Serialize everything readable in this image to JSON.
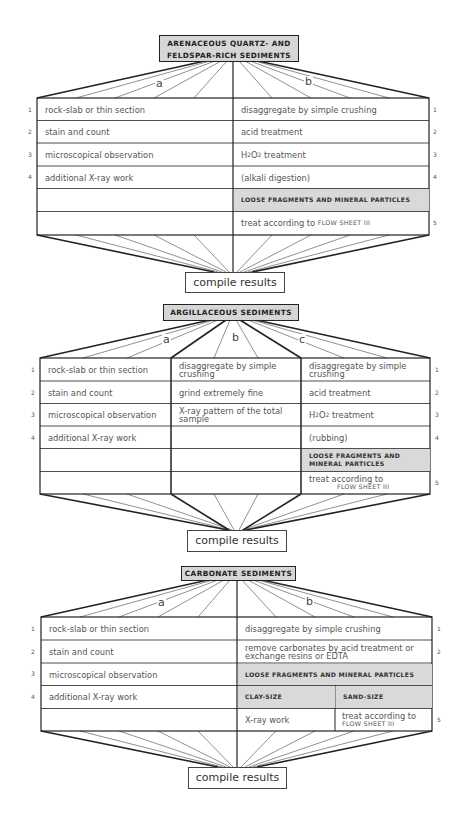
{
  "flowsheets": [
    {
      "title_line1": "ARENACEOUS QUARTZ- AND",
      "title_line2": "FELDSPAR-RICH SEDIMENTS",
      "branches": [
        "a",
        "b"
      ],
      "rows": [
        {
          "n": "1",
          "a": "rock-slab or thin section",
          "b": "disaggregate by simple crushing",
          "rn": "1"
        },
        {
          "n": "2",
          "a": "stain and count",
          "b": "acid treatment",
          "rn": "2"
        },
        {
          "n": "3",
          "a": "microscopical observation",
          "b": "H2O2 treatment",
          "rn": "3"
        },
        {
          "n": "4",
          "a": "additional X-ray work",
          "b": "(alkali digestion)",
          "rn": "4"
        },
        {
          "n": "",
          "a": "",
          "b": "LOOSE FRAGMENTS AND MINERAL PARTICLES",
          "rn": ""
        },
        {
          "n": "",
          "a": "",
          "b": "treat according to",
          "b_ref": "FLOW SHEET III",
          "rn": "5"
        }
      ],
      "compile": "compile results"
    },
    {
      "title": "ARGILLACEOUS SEDIMENTS",
      "branches": [
        "a",
        "b",
        "c"
      ],
      "rows": [
        {
          "n": "1",
          "a": "rock-slab or thin section",
          "b": "disaggregate by simple crushing",
          "c": "disaggregate by simple crushing",
          "rn": "1"
        },
        {
          "n": "2",
          "a": "stain and count",
          "b": "grind extremely fine",
          "c": "acid treatment",
          "rn": "2"
        },
        {
          "n": "3",
          "a": "microscopical observation",
          "b": "X-ray pattern of the total sample",
          "c": "H2O2 treatment",
          "rn": "3"
        },
        {
          "n": "4",
          "a": "additional X-ray work",
          "b": "",
          "c": "(rubbing)",
          "rn": "4"
        },
        {
          "n": "",
          "a": "",
          "b": "",
          "c": "LOOSE FRAGMENTS AND MINERAL PARTICLES",
          "rn": ""
        },
        {
          "n": "",
          "a": "",
          "b": "",
          "c": "treat according to",
          "c_ref": "FLOW SHEET III",
          "rn": "5"
        }
      ],
      "compile": "compile results"
    },
    {
      "title": "CARBONATE SEDIMENTS",
      "branches": [
        "a",
        "b"
      ],
      "rows": [
        {
          "n": "1",
          "a": "rock-slab or thin section",
          "b": "disaggregate by simple crushing",
          "rn": "1"
        },
        {
          "n": "2",
          "a": "stain and count",
          "b": "remove carbonates by acid treatment or exchange resins or EDTA",
          "rn": "2"
        },
        {
          "n": "3",
          "a": "microscopical observation",
          "b": "LOOSE FRAGMENTS AND MINERAL PARTICLES",
          "rn": ""
        },
        {
          "n": "4",
          "a": "additional X-ray work",
          "b1": "CLAY-SIZE",
          "b2": "SAND-SIZE",
          "rn": ""
        },
        {
          "n": "",
          "a": "",
          "b1": "X-ray work",
          "b2": "treat according to",
          "b2_ref": "FLOW SHEET III",
          "rn": "5"
        }
      ],
      "compile": "compile results"
    }
  ]
}
